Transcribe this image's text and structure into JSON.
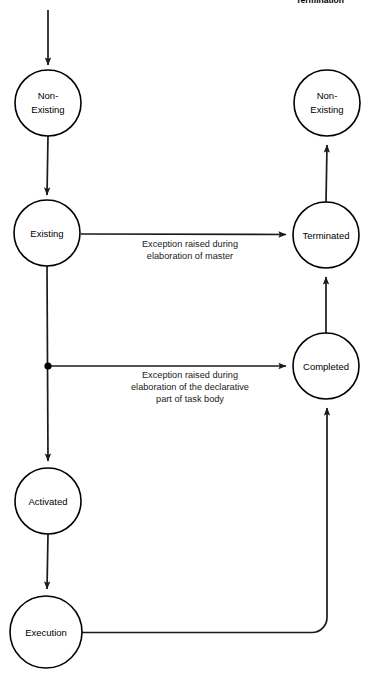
{
  "diagram": {
    "title": "Termination",
    "title_note": "partially cropped heading at top of figure",
    "states": [
      {
        "id": "non-existing-left",
        "label_line1": "Non-",
        "label_line2": "Existing",
        "cx": 48,
        "cy": 103,
        "r": 33
      },
      {
        "id": "existing",
        "label_line1": "Existing",
        "label_line2": "",
        "cx": 47,
        "cy": 233,
        "r": 33
      },
      {
        "id": "activated",
        "label_line1": "Activated",
        "label_line2": "",
        "cx": 48,
        "cy": 501,
        "r": 33
      },
      {
        "id": "execution",
        "label_line1": "Execution",
        "label_line2": "",
        "cx": 46,
        "cy": 632,
        "r": 36
      },
      {
        "id": "non-existing-right",
        "label_line1": "Non-",
        "label_line2": "Existing",
        "cx": 327,
        "cy": 103,
        "r": 33
      },
      {
        "id": "terminated",
        "label_line1": "Terminated",
        "label_line2": "",
        "cx": 326,
        "cy": 235,
        "r": 33
      },
      {
        "id": "completed",
        "label_line1": "Completed",
        "label_line2": "",
        "cx": 326,
        "cy": 366,
        "r": 33
      }
    ],
    "edge_labels": [
      {
        "id": "exception-master",
        "lines": [
          "Exception raised during",
          "elaboration of master"
        ],
        "x": 190,
        "y": 247
      },
      {
        "id": "exception-declarative",
        "lines": [
          "Exception raised during",
          "elaboration of the declarative",
          "part of task body"
        ],
        "x": 190,
        "y": 378
      }
    ],
    "colors": {
      "stroke": "#000000",
      "line": "#1a1a1a",
      "background": "#ffffff",
      "text": "#000000"
    }
  }
}
